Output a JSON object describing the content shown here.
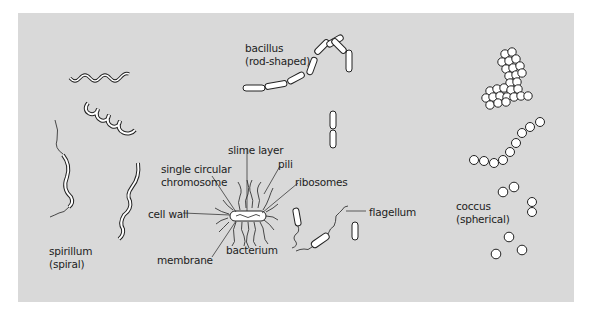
{
  "figure": {
    "background_color": "#d9d9d9",
    "groups": [
      {
        "id": "bacillus",
        "label_line1": "bacillus",
        "label_line2": "(rod-shaped)"
      },
      {
        "id": "spirillum",
        "label_line1": "spirillum",
        "label_line2": "(spiral)"
      },
      {
        "id": "coccus",
        "label_line1": "coccus",
        "label_line2": "(spherical)"
      }
    ],
    "bacterium_parts": {
      "slime_layer": "slime layer",
      "single_circular_chromosome_line1": "single circular",
      "single_circular_chromosome_line2": "chromosome",
      "pili": "pili",
      "ribosomes": "ribosomes",
      "cell_wall": "cell wall",
      "membrane": "membrane",
      "bacterium": "bacterium",
      "flagellum": "flagellum"
    }
  }
}
